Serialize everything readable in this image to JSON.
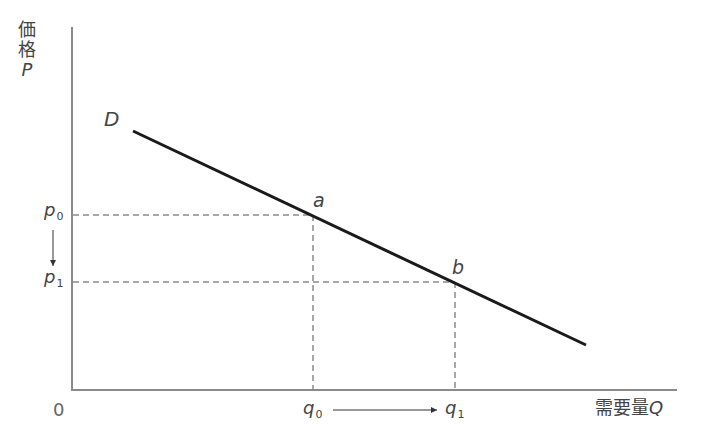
{
  "figure": {
    "type": "demand-curve-diagram",
    "y_axis": {
      "label_chars": [
        "価",
        "格"
      ],
      "symbol": "P"
    },
    "x_axis": {
      "label": "需要量",
      "symbol": "Q"
    },
    "origin": "0",
    "curve": {
      "label": "D"
    },
    "points": [
      {
        "label": "a",
        "price": "p",
        "price_sub": "0",
        "quantity": "q",
        "quantity_sub": "0"
      },
      {
        "label": "b",
        "price": "p",
        "price_sub": "1",
        "quantity": "q",
        "quantity_sub": "1"
      }
    ],
    "colors": {
      "axis": "#8a8a8a",
      "curve": "#1a1a1a",
      "guide": "#8a8a8a",
      "text": "#444444"
    }
  }
}
